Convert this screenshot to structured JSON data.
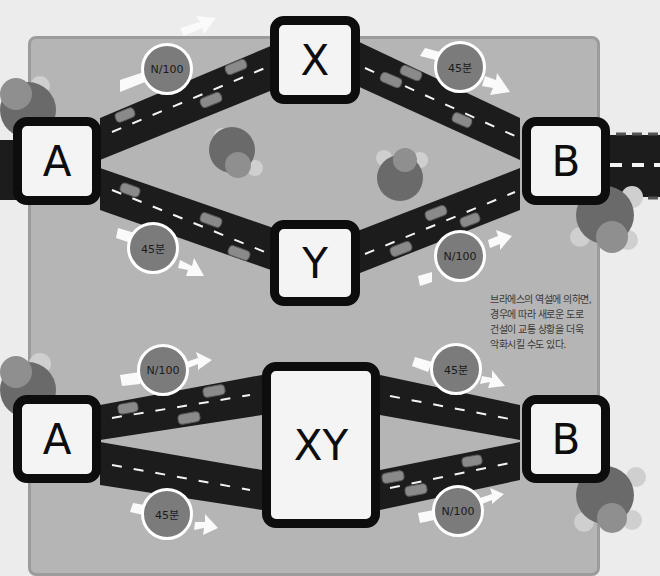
{
  "colors": {
    "background": "#ececec",
    "panel": "#b5b5b5",
    "road": "#1c1c1c",
    "node_fill": "#f4f4f4",
    "node_border": "#0d0d0d",
    "badge": "#7b7b7b",
    "tree_dark": "#6a6a6a",
    "tree_mid": "#8f8f8f",
    "tree_light": "#cfcfcf"
  },
  "top_network": {
    "nodes": {
      "start": "A",
      "upper": "X",
      "lower": "Y",
      "end": "B"
    },
    "badges": {
      "a_to_x": "N/100",
      "x_to_b": "45분",
      "a_to_y": "45분",
      "y_to_b": "N/100"
    }
  },
  "bottom_network": {
    "nodes": {
      "start": "A",
      "middle": "XY",
      "end": "B"
    },
    "badges": {
      "a_to_xy_upper": "N/100",
      "xy_to_b_upper": "45분",
      "a_to_xy_lower": "45분",
      "xy_to_b_lower": "N/100"
    }
  },
  "note": {
    "line1": "브라에스의 역설에 의하면,",
    "line2": "경우에 따라 새로운 도로",
    "line3": "건설이 교통 상황을 더욱",
    "line4": "악화시킬 수도 있다."
  }
}
